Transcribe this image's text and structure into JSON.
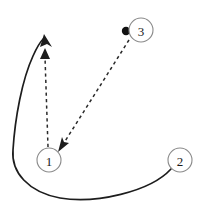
{
  "diagram": {
    "canvas": {
      "width": 205,
      "height": 212,
      "background": "#ffffff"
    },
    "colors": {
      "node_stroke": "#8a8a8a",
      "node_fill": "#ffffff",
      "label_color": "#1a1a1a",
      "solid_edge": "#1d1d1d",
      "dashed_edge": "#2a2a2a",
      "source_dot": "#111111"
    },
    "nodes": [
      {
        "id": "1",
        "label": "1",
        "cx": 49,
        "cy": 160,
        "r": 12
      },
      {
        "id": "2",
        "label": "2",
        "cx": 180,
        "cy": 160,
        "r": 12
      },
      {
        "id": "3",
        "label": "3",
        "cx": 141,
        "cy": 30,
        "r": 12
      }
    ],
    "markers": [
      {
        "name": "node-3-source-dot",
        "cx": 126,
        "cy": 31,
        "r": 4.2
      }
    ],
    "edges": [
      {
        "name": "solid-curve-from-node-2",
        "style": "solid",
        "from": "2",
        "to": "curve-endpoint-top-left",
        "arrow": true,
        "path": "M 171 169 C 150 192, 95 204, 60 198 C 28 192, 11 172, 13 150 C 15 118, 22 80, 33 56 C 37 47, 40 42, 44 38"
      },
      {
        "name": "dashed-arrow-node-1-up",
        "style": "dashed",
        "from": "1",
        "to": "vertical-endpoint-top",
        "arrow": true,
        "path": "M 48 147 L 45 57"
      },
      {
        "name": "dashed-arrow-node-3-to-node-1",
        "style": "dashed",
        "from": "3",
        "to": "1",
        "arrow": true,
        "path": "M 129 40 L 62 146"
      }
    ],
    "arrowheads": [
      {
        "name": "solid-curve-arrowhead",
        "points": "44,34 40,47 47,44 52,47"
      },
      {
        "name": "vertical-dashed-arrowhead",
        "points": "45,48 40,59 50,59"
      },
      {
        "name": "diagonal-dashed-arrowhead",
        "points": "58,152 69,143 64,142 62,137"
      }
    ]
  }
}
